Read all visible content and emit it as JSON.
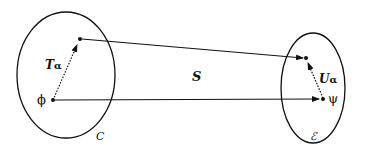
{
  "diagram": {
    "sets": [
      {
        "id": "C",
        "label": "C"
      },
      {
        "id": "E",
        "label": "ℰ"
      }
    ],
    "points": [
      {
        "id": "phi",
        "label": "ϕ",
        "set": "C"
      },
      {
        "id": "T_phi",
        "label": "",
        "set": "C"
      },
      {
        "id": "psi",
        "label": "ψ",
        "set": "E"
      },
      {
        "id": "U_psi",
        "label": "",
        "set": "E"
      }
    ],
    "mappings": [
      {
        "label": "T",
        "subscript": "α",
        "from": "phi",
        "to": "T_phi",
        "style": "dotted"
      },
      {
        "label": "U",
        "subscript": "α",
        "from": "psi",
        "to": "U_psi",
        "style": "dotted"
      },
      {
        "label": "S",
        "from": "phi",
        "to": "psi",
        "style": "solid"
      },
      {
        "label": "S",
        "from": "T_phi",
        "to": "U_psi",
        "style": "solid"
      }
    ],
    "labels": {
      "set_c": "C",
      "set_e": "ℰ",
      "phi": "ϕ",
      "psi": "ψ",
      "S": "S",
      "T": "T",
      "T_sub": "α",
      "U": "U",
      "U_sub": "α"
    },
    "colors": {
      "stroke": "#111111",
      "background": "#ffffff"
    }
  }
}
